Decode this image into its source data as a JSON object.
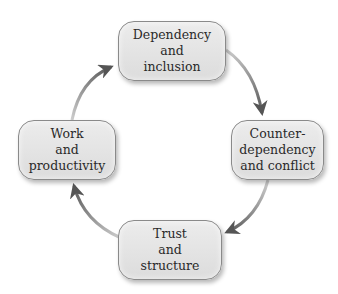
{
  "diagram": {
    "type": "cycle",
    "direction": "clockwise",
    "nodes": [
      {
        "id": "top",
        "label": "Dependency\nand\ninclusion"
      },
      {
        "id": "right",
        "label": "Counter-\ndependency\nand conflict"
      },
      {
        "id": "bottom",
        "label": "Trust\nand\nstructure"
      },
      {
        "id": "left",
        "label": "Work\nand\nproductivity"
      }
    ],
    "edges": [
      {
        "from": "top",
        "to": "right"
      },
      {
        "from": "right",
        "to": "bottom"
      },
      {
        "from": "bottom",
        "to": "left"
      },
      {
        "from": "left",
        "to": "top"
      }
    ],
    "colors": {
      "node_fill": "#e4e4e4",
      "node_border": "#8a8a8a",
      "arrow_head": "#555555",
      "arrow_tail": "#c8c8c8",
      "text": "#2a2a2a"
    }
  }
}
